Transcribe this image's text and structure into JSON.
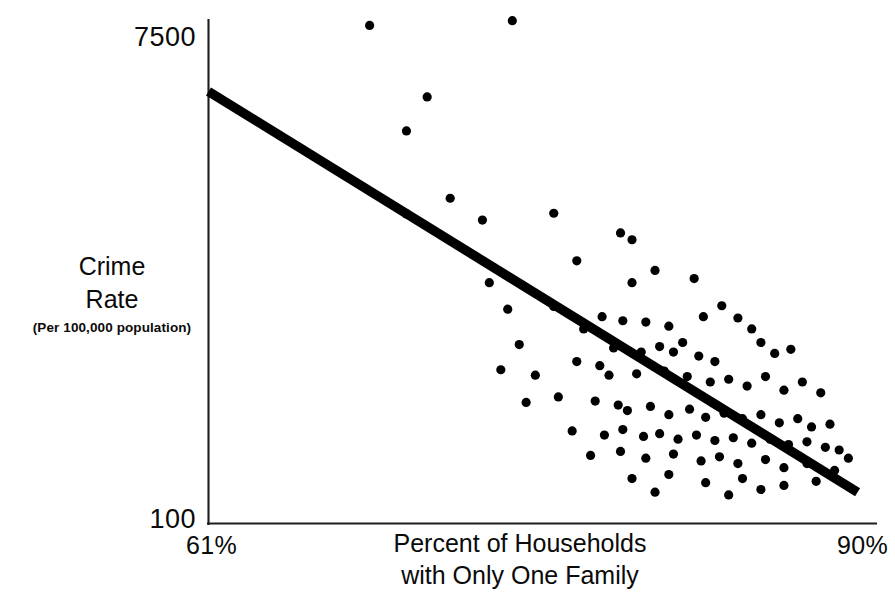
{
  "chart_data": {
    "type": "scatter",
    "title": "",
    "xlabel": "Percent of Households with Only One Family",
    "ylabel": "Crime Rate (Per 100,000 population)",
    "xlim": [
      61,
      90
    ],
    "ylim": [
      100,
      7500
    ],
    "grid": false,
    "legend": null,
    "axis": {
      "y_tick_labels": [
        "7500",
        "100"
      ],
      "x_tick_labels": [
        "61%",
        "90%"
      ],
      "y_title_line1": "Crime",
      "y_title_line2": "Rate",
      "y_title_note": "(Per 100,000 population)",
      "x_title_line1": "Percent of Households",
      "x_title_line2": "with Only One Family"
    },
    "trend_line": {
      "label": "regression line",
      "x": [
        61.0,
        89.2
      ],
      "y": [
        6450,
        560
      ],
      "color": "#000000"
    },
    "series": [
      {
        "name": "Cities",
        "marker": "circle",
        "color": "#000000",
        "points": [
          [
            68.0,
            7420
          ],
          [
            74.2,
            7490
          ],
          [
            70.5,
            6370
          ],
          [
            69.6,
            5870
          ],
          [
            71.5,
            4880
          ],
          [
            69.6,
            4650
          ],
          [
            72.9,
            4560
          ],
          [
            76.0,
            4660
          ],
          [
            78.9,
            4370
          ],
          [
            79.4,
            4270
          ],
          [
            77.0,
            3960
          ],
          [
            73.2,
            3640
          ],
          [
            79.4,
            3640
          ],
          [
            76.0,
            3290
          ],
          [
            78.1,
            3140
          ],
          [
            74.0,
            3250
          ],
          [
            80.4,
            3820
          ],
          [
            82.1,
            3700
          ],
          [
            74.5,
            2730
          ],
          [
            77.3,
            2960
          ],
          [
            79.0,
            3080
          ],
          [
            80.0,
            3060
          ],
          [
            81.0,
            3000
          ],
          [
            82.5,
            3140
          ],
          [
            83.3,
            3300
          ],
          [
            84.0,
            3120
          ],
          [
            84.6,
            2960
          ],
          [
            81.6,
            2760
          ],
          [
            78.6,
            2680
          ],
          [
            79.8,
            2620
          ],
          [
            80.6,
            2700
          ],
          [
            81.2,
            2620
          ],
          [
            82.3,
            2560
          ],
          [
            83.0,
            2480
          ],
          [
            85.0,
            2760
          ],
          [
            85.6,
            2600
          ],
          [
            86.3,
            2660
          ],
          [
            73.7,
            2360
          ],
          [
            75.2,
            2280
          ],
          [
            77.0,
            2480
          ],
          [
            78.0,
            2420
          ],
          [
            78.4,
            2280
          ],
          [
            79.6,
            2300
          ],
          [
            80.8,
            2340
          ],
          [
            81.8,
            2260
          ],
          [
            82.8,
            2180
          ],
          [
            83.6,
            2220
          ],
          [
            84.4,
            2120
          ],
          [
            85.2,
            2260
          ],
          [
            86.0,
            2060
          ],
          [
            86.8,
            2180
          ],
          [
            87.6,
            2020
          ],
          [
            74.8,
            1880
          ],
          [
            76.2,
            1960
          ],
          [
            77.8,
            1900
          ],
          [
            78.8,
            1840
          ],
          [
            79.2,
            1760
          ],
          [
            80.2,
            1820
          ],
          [
            81.0,
            1700
          ],
          [
            81.9,
            1780
          ],
          [
            82.6,
            1660
          ],
          [
            83.4,
            1720
          ],
          [
            84.2,
            1640
          ],
          [
            85.0,
            1700
          ],
          [
            85.8,
            1580
          ],
          [
            86.6,
            1640
          ],
          [
            87.2,
            1520
          ],
          [
            88.0,
            1560
          ],
          [
            76.8,
            1460
          ],
          [
            78.2,
            1400
          ],
          [
            79.0,
            1480
          ],
          [
            79.9,
            1380
          ],
          [
            80.6,
            1420
          ],
          [
            81.4,
            1340
          ],
          [
            82.2,
            1400
          ],
          [
            83.0,
            1320
          ],
          [
            83.8,
            1360
          ],
          [
            84.6,
            1280
          ],
          [
            85.4,
            1340
          ],
          [
            86.2,
            1260
          ],
          [
            87.0,
            1300
          ],
          [
            87.8,
            1220
          ],
          [
            88.4,
            1180
          ],
          [
            77.6,
            1100
          ],
          [
            78.9,
            1160
          ],
          [
            80.0,
            1060
          ],
          [
            81.2,
            1120
          ],
          [
            82.4,
            1020
          ],
          [
            83.2,
            1080
          ],
          [
            84.0,
            980
          ],
          [
            85.2,
            1040
          ],
          [
            86.0,
            920
          ],
          [
            87.0,
            980
          ],
          [
            88.2,
            880
          ],
          [
            79.4,
            760
          ],
          [
            81.0,
            820
          ],
          [
            82.6,
            700
          ],
          [
            84.2,
            760
          ],
          [
            86.0,
            660
          ],
          [
            87.4,
            720
          ],
          [
            80.4,
            560
          ],
          [
            83.6,
            520
          ],
          [
            85.0,
            600
          ],
          [
            88.8,
            1060
          ]
        ]
      }
    ]
  }
}
